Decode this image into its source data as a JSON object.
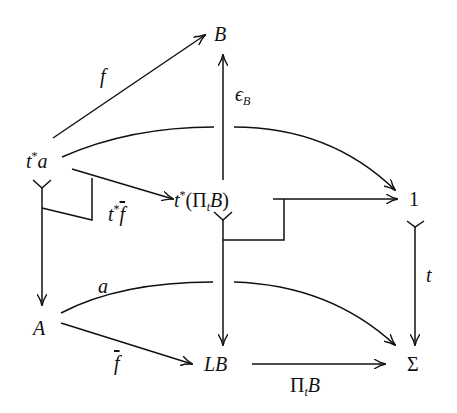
{
  "diagram": {
    "type": "commutative-diagram",
    "nodes": {
      "t_star_a": {
        "base": "t",
        "sup": "*",
        "rest": "a"
      },
      "B": {
        "label": "B"
      },
      "t_star_PitB": {
        "base": "t",
        "sup": "*",
        "open": "(",
        "pi": "Π",
        "sub": "t",
        "arg": "B",
        "close": ")"
      },
      "one": {
        "label": "1"
      },
      "A": {
        "label": "A"
      },
      "LB": {
        "label": "LB"
      },
      "Sigma": {
        "label": "Σ"
      }
    },
    "edges": {
      "f": {
        "label": "f",
        "from": "t*a",
        "to": "B"
      },
      "epsilon_B": {
        "label": "ϵ",
        "sub": "B",
        "from": "t*(ΠtB)",
        "to": "B"
      },
      "t_star_fbar": {
        "base": "t",
        "sup": "*",
        "label": "f",
        "from": "t*a",
        "to": "t*(ΠtB)"
      },
      "t_star_a_to_1": {
        "from": "t*a",
        "to": "1"
      },
      "t_star_PitB_to_1": {
        "from": "t*(ΠtB)",
        "to": "1"
      },
      "t": {
        "label": "t",
        "from": "1",
        "to": "Σ"
      },
      "t_star_a_to_A": {
        "from": "t*a",
        "to": "A"
      },
      "t_star_PitB_to_LB": {
        "from": "t*(ΠtB)",
        "to": "LB"
      },
      "a": {
        "label": "a",
        "from": "A",
        "to": "Σ"
      },
      "fbar": {
        "label": "f",
        "from": "A",
        "to": "LB"
      },
      "PitB": {
        "pi": "Π",
        "sub": "t",
        "arg": "B",
        "from": "LB",
        "to": "Σ"
      }
    }
  }
}
